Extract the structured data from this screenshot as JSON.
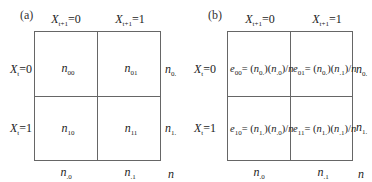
{
  "panels": {
    "a": {
      "tag": "(a)",
      "col_headers": [
        {
          "var": "X",
          "sub": "t+1",
          "eq": "=0"
        },
        {
          "var": "X",
          "sub": "t+1",
          "eq": "=1"
        }
      ],
      "row_headers": [
        {
          "var": "X",
          "sub": "t",
          "eq": "=0"
        },
        {
          "var": "X",
          "sub": "t",
          "eq": "=1"
        }
      ],
      "cells": [
        [
          {
            "var": "n",
            "sub": "00"
          },
          {
            "var": "n",
            "sub": "01"
          }
        ],
        [
          {
            "var": "n",
            "sub": "10"
          },
          {
            "var": "n",
            "sub": "11"
          }
        ]
      ],
      "row_totals": [
        {
          "var": "n",
          "sub": "0."
        },
        {
          "var": "n",
          "sub": "1."
        }
      ],
      "col_totals": [
        {
          "var": "n",
          "sub": ".0"
        },
        {
          "var": "n",
          "sub": ".1"
        }
      ],
      "grand_total": "n"
    },
    "b": {
      "tag": "(b)",
      "col_headers": [
        {
          "var": "X",
          "sub": "t+1",
          "eq": "=0"
        },
        {
          "var": "X",
          "sub": "t+1",
          "eq": "=1"
        }
      ],
      "row_headers": [
        {
          "var": "X",
          "sub": "t",
          "eq": "=0"
        },
        {
          "var": "X",
          "sub": "t",
          "eq": "=1"
        }
      ],
      "cells": [
        [
          {
            "e": "e",
            "e_sub": "00",
            "eq": "= (",
            "n1": "n",
            "n1_sub": "0.",
            "mid": ")(",
            "n2": "n",
            "n2_sub": ".0",
            "tail": ")/",
            "n3": "n"
          },
          {
            "e": "e",
            "e_sub": "01",
            "eq": "= (",
            "n1": "n",
            "n1_sub": "0.",
            "mid": ")(",
            "n2": "n",
            "n2_sub": ".1",
            "tail": ")/",
            "n3": "n"
          }
        ],
        [
          {
            "e": "e",
            "e_sub": "10",
            "eq": "= (",
            "n1": "n",
            "n1_sub": "1.",
            "mid": ")(",
            "n2": "n",
            "n2_sub": ".0",
            "tail": ")/",
            "n3": "n"
          },
          {
            "e": "e",
            "e_sub": "11",
            "eq": "= (",
            "n1": "n",
            "n1_sub": "1.",
            "mid": ")(",
            "n2": "n",
            "n2_sub": ".1",
            "tail": ")/",
            "n3": "n"
          }
        ]
      ],
      "row_totals": [
        {
          "var": "n",
          "sub": "0."
        },
        {
          "var": "n",
          "sub": "1."
        }
      ],
      "col_totals": [
        {
          "var": "n",
          "sub": ".0"
        },
        {
          "var": "n",
          "sub": ".1"
        }
      ],
      "grand_total": "n"
    }
  },
  "colors": {
    "line": "#666666",
    "text": "#222222",
    "background": "#ffffff"
  }
}
